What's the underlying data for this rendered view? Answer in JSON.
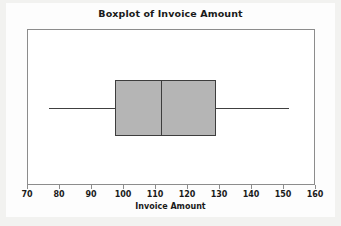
{
  "figure": {
    "title": "Boxplot of Invoice Amount",
    "background_color": "#f2f2f0",
    "plot_background_color": "#ffffff",
    "frame_color": "#8c8c8c"
  },
  "chart_data": {
    "type": "box",
    "title": "Boxplot of Invoice Amount",
    "xlabel": "Invoice Amount",
    "ylabel": "",
    "orientation": "horizontal",
    "xlim": [
      70,
      160
    ],
    "xticks": [
      70,
      80,
      90,
      100,
      110,
      120,
      130,
      140,
      150,
      160
    ],
    "xtick_labels": [
      "70",
      "80",
      "90",
      "100",
      "110",
      "120",
      "130",
      "140",
      "150",
      "160"
    ],
    "grid": false,
    "legend": false,
    "box_fill_color": "#b5b5b5",
    "box_edge_color": "#3d3d3d",
    "whisker_color": "#404040",
    "boxes": [
      {
        "label": "Invoice Amount",
        "min": 77,
        "q1": 97.5,
        "median": 112,
        "q3": 129,
        "max": 152,
        "outliers": []
      }
    ]
  }
}
